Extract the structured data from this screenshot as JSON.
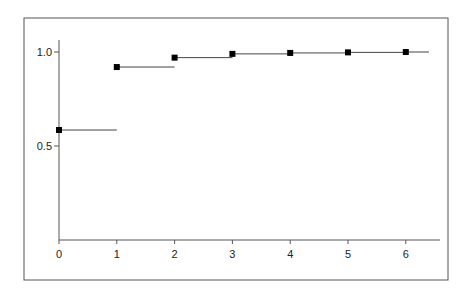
{
  "chart_data": {
    "type": "line",
    "subtype": "step-post",
    "title": "",
    "xlabel": "",
    "ylabel": "",
    "x": [
      0,
      1,
      2,
      3,
      4,
      5,
      6
    ],
    "series": [
      {
        "name": "",
        "values": [
          0.585,
          0.92,
          0.97,
          0.99,
          0.995,
          0.998,
          1.0
        ]
      }
    ],
    "x_ticks": [
      "0",
      "1",
      "2",
      "3",
      "4",
      "5",
      "6"
    ],
    "y_ticks": [
      "0.5",
      "1.0"
    ],
    "xlim": [
      0,
      6.4
    ],
    "ylim": [
      0.0,
      1.1
    ],
    "grid": false,
    "legend": "none",
    "marker": "square",
    "frame": true
  }
}
